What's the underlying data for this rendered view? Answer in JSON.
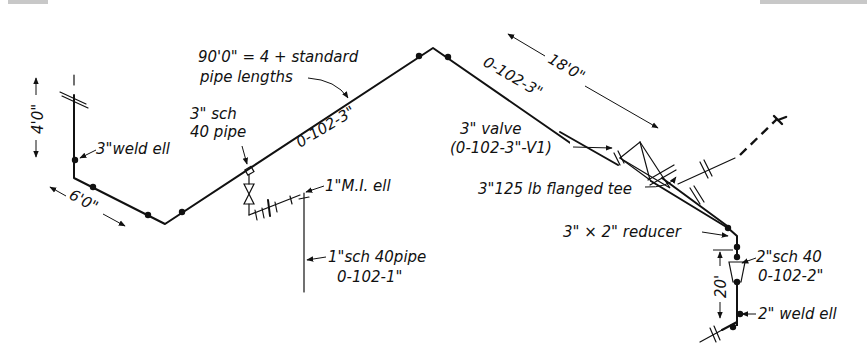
{
  "drawing": {
    "type": "isometric piping drawing",
    "line_numbers": {
      "main_3in": "0-102-3\"",
      "main_3in_b": "0-102-3\"",
      "branch_1in": "0-102-1\"",
      "branch_2in": "0-102-2\""
    },
    "dimensions": {
      "vertical_left": "4'0\"",
      "horizontal_left": "6'0\"",
      "run_right": "18'0\"",
      "vertical_right": "20'"
    },
    "callouts": {
      "total_length_line1": "90'0\" = 4 + standard",
      "total_length_line2": "pipe lengths",
      "weld_ell_3in": "3\"weld ell",
      "sch40_3in_line1": "3\" sch",
      "sch40_3in_line2": "40 pipe",
      "mi_ell_1in": "1\"M.I. ell",
      "sch40_1in_line1": "1\"sch 40pipe",
      "sch40_1in_line2": "0-102-1\"",
      "valve_line1": "3\" valve",
      "valve_line2": "(0-102-3\"-V1)",
      "flanged_tee": "3\"125 lb flanged tee",
      "reducer": "3\" × 2\" reducer",
      "sch40_2in_line1": "2\"sch 40",
      "sch40_2in_line2": "0-102-2\"",
      "weld_ell_2in": "2\" weld ell"
    }
  }
}
